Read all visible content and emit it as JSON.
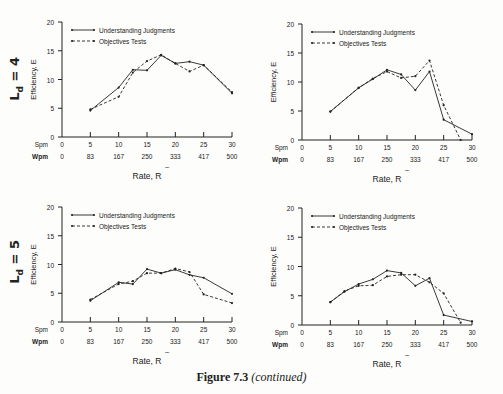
{
  "caption": {
    "figure": "Figure 7.3",
    "note": "(continued)"
  },
  "row_labels": [
    {
      "text": "L",
      "sub": "d",
      "value": "= 4"
    },
    {
      "text": "L",
      "sub": "d",
      "value": "= 5"
    }
  ],
  "colors": {
    "ink": "#222222",
    "background": "#fdfdfb"
  },
  "chart_data": [
    {
      "type": "line",
      "panel": "top-left",
      "row_label": "Ld = 4",
      "title": "",
      "xlabel": "Rate, R~",
      "ylabel": "Efficiency, E~",
      "ylim": [
        0,
        20
      ],
      "yticks": [
        0,
        5,
        10,
        15,
        20
      ],
      "xlim": [
        0,
        30
      ],
      "xticks_spm": [
        "0",
        "5",
        "10",
        "15",
        "20",
        "25",
        "30"
      ],
      "xticks_wpm": [
        "0",
        "83",
        "167",
        "250",
        "333",
        "417",
        "500"
      ],
      "grid": false,
      "legend_position": "upper-left",
      "series": [
        {
          "name": "Understanding Judgments",
          "style": "solid",
          "x": [
            5,
            10,
            12.5,
            15,
            17.5,
            20,
            22.5,
            25,
            30
          ],
          "y": [
            4.6,
            8.6,
            11.7,
            11.6,
            14.2,
            12.8,
            13.1,
            12.5,
            7.6
          ]
        },
        {
          "name": "Objectives Tests",
          "style": "dashed",
          "x": [
            5,
            10,
            12.5,
            15,
            17.5,
            20,
            22.5,
            25,
            30
          ],
          "y": [
            4.8,
            7.0,
            11.2,
            13.2,
            14.3,
            12.8,
            11.4,
            12.5,
            7.8
          ]
        }
      ]
    },
    {
      "type": "line",
      "panel": "top-right",
      "row_label": "Ld = 4",
      "title": "",
      "xlabel": "Rate, R~",
      "ylabel": "Efficiency, E~",
      "ylim": [
        0,
        20
      ],
      "yticks": [
        0,
        5,
        10,
        15,
        20
      ],
      "xlim": [
        0,
        30
      ],
      "xticks_spm": [
        "0",
        "5",
        "10",
        "15",
        "20",
        "25",
        "30"
      ],
      "xticks_wpm": [
        "0",
        "83",
        "167",
        "250",
        "333",
        "417",
        "500"
      ],
      "grid": false,
      "legend_position": "upper-left",
      "series": [
        {
          "name": "Understanding Judgments",
          "style": "solid",
          "x": [
            5,
            10,
            12.5,
            15,
            17.5,
            20,
            22.5,
            25,
            30
          ],
          "y": [
            4.9,
            9.0,
            10.5,
            12.1,
            11.3,
            8.6,
            11.8,
            3.5,
            1.0
          ]
        },
        {
          "name": "Objectives Tests",
          "style": "dashed",
          "x": [
            5,
            10,
            12.5,
            15,
            17.5,
            20,
            22.5,
            25,
            28
          ],
          "y": [
            4.9,
            9.0,
            10.6,
            11.8,
            10.7,
            11.0,
            13.7,
            6.0,
            0.0
          ]
        }
      ]
    },
    {
      "type": "line",
      "panel": "bottom-left",
      "row_label": "Ld = 5",
      "title": "",
      "xlabel": "Rate, R~",
      "ylabel": "Efficiency, E~",
      "ylim": [
        0,
        20
      ],
      "yticks": [
        0,
        5,
        10,
        15,
        20
      ],
      "xlim": [
        0,
        30
      ],
      "xticks_spm": [
        "0",
        "5",
        "10",
        "15",
        "20",
        "25",
        "30"
      ],
      "xticks_wpm": [
        "0",
        "83",
        "167",
        "250",
        "333",
        "417",
        "500"
      ],
      "grid": false,
      "legend_position": "upper-left",
      "series": [
        {
          "name": "Understanding Judgments",
          "style": "solid",
          "x": [
            5,
            10,
            12.5,
            15,
            17.5,
            20,
            22.5,
            25,
            30
          ],
          "y": [
            3.7,
            6.9,
            6.6,
            9.2,
            8.5,
            9.1,
            8.2,
            7.7,
            4.9
          ]
        },
        {
          "name": "Objectives Tests",
          "style": "dashed",
          "x": [
            5,
            10,
            12.5,
            15,
            17.5,
            20,
            22.5,
            25,
            30
          ],
          "y": [
            3.9,
            6.6,
            7.1,
            8.5,
            8.5,
            9.3,
            8.7,
            4.8,
            3.3
          ]
        }
      ]
    },
    {
      "type": "line",
      "panel": "bottom-right",
      "row_label": "Ld = 5",
      "title": "",
      "xlabel": "Rate, R~",
      "ylabel": "Efficiency, E~",
      "ylim": [
        0,
        20
      ],
      "yticks": [
        0,
        5,
        10,
        15,
        20
      ],
      "xlim": [
        0,
        30
      ],
      "xticks_spm": [
        "0",
        "5",
        "10",
        "15",
        "20",
        "25",
        "30"
      ],
      "xticks_wpm": [
        "0",
        "83",
        "167",
        "250",
        "333",
        "417",
        "500"
      ],
      "grid": false,
      "legend_position": "upper-left",
      "series": [
        {
          "name": "Understanding Judgments",
          "style": "solid",
          "x": [
            5,
            7.5,
            10,
            12.5,
            15,
            17.5,
            20,
            22.5,
            25,
            30
          ],
          "y": [
            3.9,
            5.7,
            7.0,
            7.8,
            9.3,
            8.9,
            6.7,
            8.0,
            1.7,
            0.6
          ]
        },
        {
          "name": "Objectives Tests",
          "style": "dashed",
          "x": [
            5,
            7.5,
            10,
            12.5,
            15,
            17.5,
            20,
            22.5,
            25,
            28
          ],
          "y": [
            3.9,
            5.8,
            6.7,
            6.8,
            8.3,
            8.6,
            8.6,
            7.3,
            5.4,
            0.4
          ]
        }
      ]
    }
  ]
}
